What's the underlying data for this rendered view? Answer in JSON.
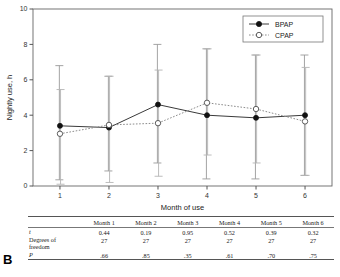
{
  "panel": {
    "label": "B"
  },
  "chart_data": {
    "type": "line",
    "title": "",
    "xlabel": "Month of use",
    "ylabel": "Nightly use, h",
    "x": [
      1,
      2,
      3,
      4,
      5,
      6
    ],
    "xtick_labels": [
      "1",
      "2",
      "3",
      "4",
      "5",
      "6"
    ],
    "xlim": [
      0.45,
      6.55
    ],
    "ylim": [
      0,
      10
    ],
    "ytick_labels": [
      "0",
      "2",
      "4",
      "6",
      "8",
      "10"
    ],
    "yticks": [
      0,
      2,
      4,
      6,
      8,
      10
    ],
    "grid": false,
    "legend_position": "top-right",
    "series": [
      {
        "name": "BPAP",
        "marker": "filled-circle",
        "linestyle": "solid",
        "color": "#111111",
        "values": [
          3.4,
          3.3,
          4.6,
          4.0,
          3.85,
          4.0
        ],
        "err_low": [
          0.35,
          0.85,
          1.3,
          0.4,
          0.4,
          0.6
        ],
        "err_high": [
          6.8,
          6.2,
          8.0,
          7.75,
          7.4,
          7.4
        ]
      },
      {
        "name": "CPAP",
        "marker": "open-circle",
        "linestyle": "dotted",
        "color": "#8c8c8c",
        "values": [
          2.95,
          3.45,
          3.55,
          4.7,
          4.35,
          3.65
        ],
        "err_low": [
          0.1,
          0.2,
          0.55,
          1.75,
          1.3,
          0.6
        ],
        "err_high": [
          5.45,
          6.2,
          6.55,
          7.75,
          7.4,
          6.7
        ]
      }
    ]
  },
  "stats_table": {
    "columns": [
      "",
      "Month 1",
      "Month 2",
      "Month 3",
      "Month 4",
      "Month 5",
      "Month 6"
    ],
    "rows": [
      {
        "label": "t",
        "italic": true,
        "values": [
          "0.44",
          "0.19",
          "0.95",
          "0.52",
          "0.39",
          "0.32"
        ]
      },
      {
        "label": "Degrees of\nfreedom",
        "italic": false,
        "values": [
          "27",
          "27",
          "27",
          "27",
          "27",
          "27"
        ]
      },
      {
        "label": "P",
        "italic": true,
        "values": [
          ".66",
          ".85",
          ".35",
          ".61",
          ".70",
          ".75"
        ]
      }
    ]
  }
}
